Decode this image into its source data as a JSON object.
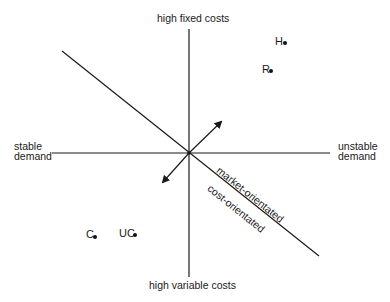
{
  "diagram": {
    "axes": {
      "top": "high fixed costs",
      "bottom": "high variable costs",
      "left_line1": "stable",
      "left_line2": "demand",
      "right_line1": "unstable",
      "right_line2": "demand"
    },
    "diagonal_labels": {
      "upper": "market-orientated",
      "lower": "cost-orientated"
    },
    "points": [
      {
        "label": "H",
        "x": 285,
        "y": 43
      },
      {
        "label": "R",
        "x": 271,
        "y": 71
      },
      {
        "label": "C",
        "x": 95,
        "y": 237
      },
      {
        "label": "UC",
        "x": 135,
        "y": 235
      }
    ],
    "colors": {
      "line": "#1a1a1a",
      "background": "#ffffff"
    }
  }
}
